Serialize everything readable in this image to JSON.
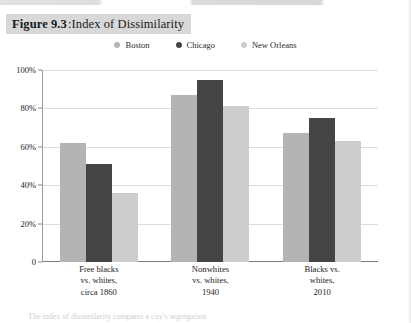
{
  "figure": {
    "number_label": "Figure 9.3",
    "separator": ": ",
    "title": "Index of Dissimilarity"
  },
  "caption": {
    "partial_text": "The index of dissimilarity compares a city's segregation"
  },
  "colors": {
    "boston": "#b4b4b4",
    "chicago": "#444444",
    "new_orleans": "#cdcdcd",
    "gridline": "#dedede",
    "axis": "#8a8a8a",
    "title_band": "#d8d8d8"
  },
  "legend": {
    "position": "top-center",
    "items": [
      {
        "label": "Boston",
        "color": "#b4b4b4",
        "marker": "circle-dot-icon"
      },
      {
        "label": "Chicago",
        "color": "#444444",
        "marker": "circle-dot-icon"
      },
      {
        "label": "New Orleans",
        "color": "#cdcdcd",
        "marker": "circle-dot-icon"
      }
    ]
  },
  "axes": {
    "y_ticks": [
      "100%",
      "80%",
      "60%",
      "40%",
      "20%",
      "0"
    ],
    "y_tick_values": [
      100,
      80,
      60,
      40,
      20,
      0
    ]
  },
  "chart_data": {
    "type": "bar",
    "title": "Index of Dissimilarity",
    "xlabel": "",
    "ylabel": "",
    "ylim": [
      0,
      100
    ],
    "grid": true,
    "legend_position": "top-center",
    "categories": [
      "Free blacks vs. whites, circa 1860",
      "Nonwhites vs. whites, 1940",
      "Blacks vs. whites, 2010"
    ],
    "category_lines": [
      [
        "Free blacks",
        "vs. whites,",
        "circa 1860"
      ],
      [
        "Nonwhites",
        "vs. whites,",
        "1940"
      ],
      [
        "Blacks vs.",
        "whites,",
        "2010"
      ]
    ],
    "series": [
      {
        "name": "Boston",
        "color": "#b4b4b4",
        "values": [
          62,
          87,
          67
        ]
      },
      {
        "name": "Chicago",
        "color": "#444444",
        "values": [
          51,
          95,
          75
        ]
      },
      {
        "name": "New Orleans",
        "color": "#cdcdcd",
        "values": [
          36,
          81,
          63
        ]
      }
    ]
  }
}
